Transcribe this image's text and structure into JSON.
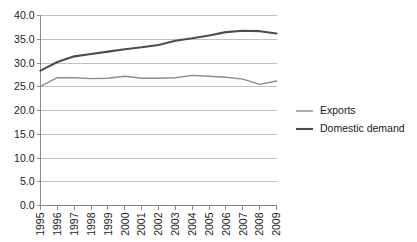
{
  "chart_data": {
    "type": "line",
    "title": "",
    "xlabel": "",
    "ylabel": "",
    "grid": true,
    "legend_position": "right",
    "ylim": [
      0.0,
      40.0
    ],
    "ytick_labels": [
      "0.0",
      "5.0",
      "10.0",
      "15.0",
      "20.0",
      "25.0",
      "30.0",
      "35.0",
      "40.0"
    ],
    "ytick_values": [
      0.0,
      5.0,
      10.0,
      15.0,
      20.0,
      25.0,
      30.0,
      35.0,
      40.0
    ],
    "categories": [
      "1995",
      "1996",
      "1997",
      "1998",
      "1999",
      "2000",
      "2001",
      "2002",
      "2003",
      "2004",
      "2005",
      "2006",
      "2007",
      "2008",
      "2009"
    ],
    "series": [
      {
        "name": "Exports",
        "color": "#8c8c8c",
        "width": 1.4,
        "values": [
          25.1,
          26.9,
          26.9,
          26.7,
          26.8,
          27.2,
          26.8,
          26.8,
          26.9,
          27.4,
          27.2,
          27.0,
          26.6,
          25.5,
          26.2
        ]
      },
      {
        "name": "Domestic demand",
        "color": "#4d4d4d",
        "width": 2.1,
        "values": [
          28.4,
          30.2,
          31.4,
          31.9,
          32.4,
          32.9,
          33.3,
          33.8,
          34.7,
          35.2,
          35.8,
          36.5,
          36.8,
          36.7,
          36.2
        ]
      }
    ]
  },
  "legend": {
    "entries": [
      {
        "label": "Exports"
      },
      {
        "label": "Domestic demand"
      }
    ]
  },
  "colors": {
    "exports": "#8c8c8c",
    "domestic_demand": "#4d4d4d",
    "gridline": "#a6a6a6",
    "axis": "#7f7f7f",
    "text": "#1a1a1a",
    "background": "#ffffff"
  }
}
